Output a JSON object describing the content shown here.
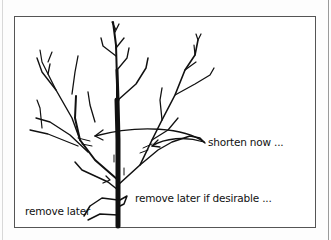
{
  "diagram": {
    "type": "pruning illustration",
    "annotations": [
      {
        "id": "shorten",
        "text": "shorten now ..."
      },
      {
        "id": "remove_if",
        "text": "remove later if desirable ..."
      },
      {
        "id": "remove",
        "text": "remove later"
      }
    ],
    "colors": {
      "ink": "#111111",
      "frame": "#555555",
      "background": "#ffffff"
    }
  }
}
